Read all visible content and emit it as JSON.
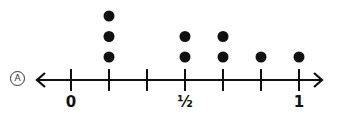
{
  "option_label": "A",
  "chart_data": {
    "type": "dot-plot",
    "title": "",
    "xlabel": "",
    "ylabel": "",
    "xlim": [
      0,
      1
    ],
    "tick_step": "1/6",
    "ticks": [
      "0",
      "1/6",
      "1/3",
      "1/2",
      "2/3",
      "5/6",
      "1"
    ],
    "tick_labels": [
      {
        "value": "0",
        "text": "0"
      },
      {
        "value": "1/2",
        "text": "½"
      },
      {
        "value": "1",
        "text": "1"
      }
    ],
    "points": [
      {
        "x": "1/6",
        "count": 3
      },
      {
        "x": "1/2",
        "count": 2
      },
      {
        "x": "2/3",
        "count": 2
      },
      {
        "x": "5/6",
        "count": 1
      },
      {
        "x": "1",
        "count": 1
      }
    ],
    "arrows": "both",
    "grid": false
  },
  "colors": {
    "ink": "#111111",
    "background": "#ffffff"
  }
}
